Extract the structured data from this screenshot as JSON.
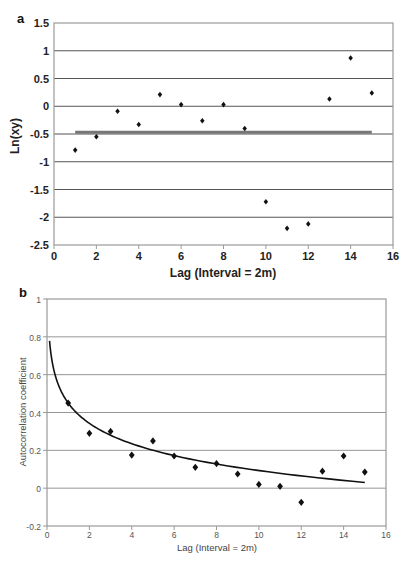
{
  "chart_data": [
    {
      "panel": "a",
      "type": "scatter",
      "title": "",
      "xlabel": "Lag (Interval = 2m)",
      "ylabel": "Ln(xy)",
      "xlim": [
        0,
        16
      ],
      "ylim": [
        -2.5,
        1.5
      ],
      "xticks": [
        0,
        2,
        4,
        6,
        8,
        10,
        12,
        14,
        16
      ],
      "yticks": [
        1.5,
        1,
        0.5,
        0,
        -0.5,
        -1,
        -1.5,
        -2,
        -2.5
      ],
      "ytick_labels": [
        "1.5",
        "1",
        "0.5",
        "0",
        "-0.5",
        "-1",
        "-1.5",
        "-2",
        "-2.5"
      ],
      "grid": true,
      "legend": null,
      "series": [
        {
          "name": "Ln(xy)",
          "type": "scatter",
          "marker": "diamond",
          "x": [
            1,
            2,
            3,
            4,
            5,
            6,
            7,
            8,
            9,
            10,
            11,
            12,
            13,
            14,
            15
          ],
          "y": [
            -0.79,
            -0.55,
            -0.09,
            -0.33,
            0.21,
            0.03,
            -0.26,
            0.03,
            -0.4,
            -1.72,
            -2.2,
            -2.12,
            0.13,
            0.87,
            0.24
          ]
        },
        {
          "name": "mean",
          "type": "line",
          "x": [
            1,
            15
          ],
          "y": [
            -0.47,
            -0.47
          ]
        }
      ]
    },
    {
      "panel": "b",
      "type": "scatter",
      "title": "",
      "xlabel": "Lag (Interval = 2m)",
      "ylabel": "Autocorrelation coefficient",
      "xlim": [
        0,
        16
      ],
      "ylim": [
        -0.2,
        1
      ],
      "xticks": [
        0,
        2,
        4,
        6,
        8,
        10,
        12,
        14,
        16
      ],
      "yticks": [
        1,
        0.8,
        0.6,
        0.4,
        0.2,
        0,
        -0.2
      ],
      "ytick_labels": [
        "1",
        "0.8",
        "0.6",
        "0.4",
        "0.2",
        "0",
        "-0.2"
      ],
      "grid": true,
      "legend": null,
      "series": [
        {
          "name": "Autocorrelation coefficient",
          "type": "scatter",
          "marker": "diamond",
          "x": [
            1,
            2,
            3,
            4,
            5,
            6,
            7,
            8,
            9,
            10,
            11,
            12,
            13,
            14,
            15
          ],
          "y": [
            0.45,
            0.29,
            0.3,
            0.175,
            0.25,
            0.17,
            0.11,
            0.13,
            0.075,
            0.02,
            0.01,
            -0.075,
            0.09,
            0.17,
            0.085
          ]
        },
        {
          "name": "logarithmic fit",
          "type": "line",
          "equation": "y = 0.45 - 0.155 ln(x)",
          "x_range": [
            0.12,
            15
          ]
        }
      ]
    }
  ],
  "panels": {
    "a": {
      "label": "a",
      "xlabel": "Lag (Interval = 2m)",
      "ylabel": "Ln(xy)"
    },
    "b": {
      "label": "b",
      "xlabel": "Lag (Interval = 2m)",
      "ylabel": "Autocorrelation coefficient"
    }
  },
  "colors": {
    "points": "#111111",
    "gridline_a": "#555555",
    "mean_line": "#777777",
    "gridline_b": "#8a8a8a",
    "fit_line": "#111111",
    "frame": "#9a9a9a"
  }
}
